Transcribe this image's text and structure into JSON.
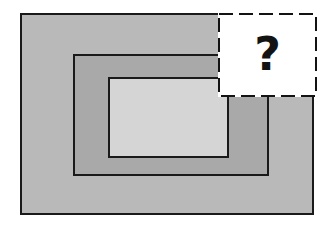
{
  "figure": {
    "background_color": "#ffffff",
    "width": 333,
    "height": 229
  },
  "shapes": {
    "outer_rectangle": {
      "name": "outer-rectangle",
      "fill_color": "#b9b9b9",
      "stroke_color": "#1a1a1a",
      "stroke_width": 2,
      "x": 20,
      "y": 13,
      "width": 294,
      "height": 202,
      "label": ""
    },
    "middle_rectangle": {
      "name": "middle-rectangle",
      "fill_color": "#a9a9a9",
      "stroke_color": "#1a1a1a",
      "stroke_width": 2,
      "x": 73,
      "y": 54,
      "width": 196,
      "height": 122,
      "label": ""
    },
    "inner_rectangle": {
      "name": "inner-rectangle",
      "fill_color": "#d5d5d5",
      "stroke_color": "#1a1a1a",
      "stroke_width": 2,
      "x": 108,
      "y": 77,
      "width": 121,
      "height": 81,
      "label": ""
    }
  },
  "occluder": {
    "name": "question-box",
    "symbol": "?",
    "fill_color": "#ffffff",
    "stroke_color": "#131313",
    "stroke_width": 2,
    "stroke_style": "dashed",
    "dash_length": 14,
    "dash_gap": 6,
    "x": 218,
    "y": 13,
    "width": 99,
    "height": 84
  }
}
